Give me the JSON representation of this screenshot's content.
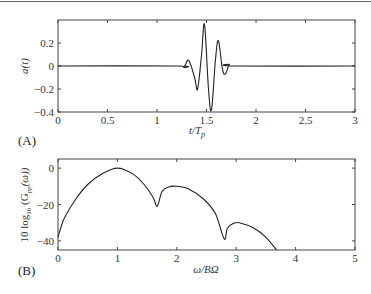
{
  "chart_data": [
    {
      "panel": "(A)",
      "type": "line",
      "xlabel": "t/T_p",
      "ylabel": "a(t)",
      "xlim": [
        0,
        3
      ],
      "ylim": [
        -0.4,
        0.4
      ],
      "xticks": [
        "0",
        "0.5",
        "1",
        "1.5",
        "2",
        "2.5",
        "3"
      ],
      "yticks": [
        "0.2",
        "0",
        "-0.2",
        "-0.4"
      ],
      "grid": false,
      "series": [
        {
          "name": "a(t)",
          "x": [
            0,
            1.2,
            1.27,
            1.32,
            1.38,
            1.41,
            1.45,
            1.48,
            1.52,
            1.55,
            1.59,
            1.62,
            1.66,
            1.69,
            1.73,
            1.78,
            3
          ],
          "y": [
            0,
            0,
            -0.01,
            0.05,
            -0.1,
            -0.2,
            0.1,
            0.36,
            -0.2,
            -0.38,
            0.05,
            0.22,
            -0.02,
            -0.07,
            0.01,
            0,
            0
          ]
        }
      ]
    },
    {
      "panel": "(B)",
      "type": "line",
      "xlabel": "ω/BΩ",
      "ylabel": "10 log10 (G_pp(ω))",
      "xlim": [
        0,
        5
      ],
      "ylim": [
        -45,
        5
      ],
      "xticks": [
        "0",
        "1",
        "2",
        "3",
        "4",
        "5"
      ],
      "yticks": [
        "0",
        "-20",
        "-40"
      ],
      "grid": false,
      "series": [
        {
          "name": "10 log10 G_pp(ω)",
          "x": [
            0,
            0.1,
            0.3,
            0.5,
            0.75,
            1.0,
            1.25,
            1.45,
            1.6,
            1.67,
            1.75,
            1.85,
            2.0,
            2.2,
            2.45,
            2.65,
            2.8,
            2.85,
            2.95,
            3.05,
            3.3,
            3.5,
            3.68
          ],
          "y": [
            -38,
            -28,
            -17,
            -9,
            -3,
            0,
            -3,
            -9,
            -16,
            -21,
            -13,
            -10.5,
            -10,
            -11.5,
            -17,
            -25,
            -39,
            -33,
            -30.5,
            -30,
            -33,
            -38,
            -45
          ]
        }
      ]
    }
  ],
  "labels": {
    "panel_a": "(A)",
    "panel_b": "(B)",
    "a_xlabel_main": "t/T",
    "a_xlabel_sub": "p",
    "a_ylabel": "a(t)",
    "b_xlabel": "ω/BΩ",
    "b_ylabel_prefix": "10 log",
    "b_ylabel_sub": "10",
    "b_ylabel_mid": " (G",
    "b_ylabel_sub2": "pp",
    "b_ylabel_suffix": "(ω))"
  },
  "axis_a": {
    "xticks": [
      "0",
      "0.5",
      "1",
      "1.5",
      "2",
      "2.5",
      "3"
    ],
    "yticks": [
      "0.2",
      "0",
      "−0.2",
      "−0.4"
    ]
  },
  "axis_b": {
    "xticks": [
      "0",
      "1",
      "2",
      "3",
      "4",
      "5"
    ],
    "yticks": [
      "0",
      "−20",
      "−40"
    ]
  },
  "colors": {
    "line": "#222222",
    "axes": "#444444"
  }
}
